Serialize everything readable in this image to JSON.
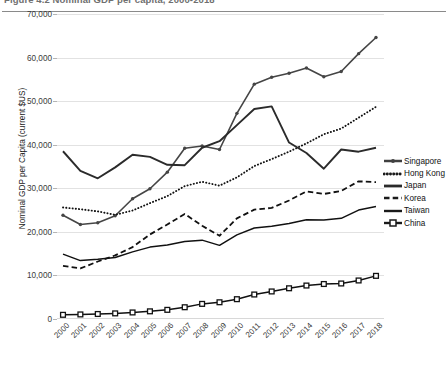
{
  "figure": {
    "caption_clipped": "Figure 4.2  Nominal GDP per capita, 2000-2018",
    "ylabel": "Nominal GDP per Capita (current $US)"
  },
  "legend": {
    "position": "right",
    "items": [
      {
        "label": "Singapore",
        "key": "line-marker-small",
        "color": "#404040"
      },
      {
        "label": "Hong Kong",
        "key": "dotted",
        "color": "#1a1a1a"
      },
      {
        "label": "Japan",
        "key": "solid-thick",
        "color": "#2b2b2b"
      },
      {
        "label": "Korea",
        "key": "dashed",
        "color": "#1a1a1a"
      },
      {
        "label": "Taiwan",
        "key": "solid-thin",
        "color": "#1a1a1a"
      },
      {
        "label": "China",
        "key": "line-marker-square",
        "color": "#1a1a1a"
      }
    ]
  },
  "axes": {
    "y_ticks": [
      "70,000",
      "60,000",
      "50,000",
      "40,000",
      "30,000",
      "20,000",
      "10,000",
      "0"
    ],
    "y_tick_values": [
      70000,
      60000,
      50000,
      40000,
      30000,
      20000,
      10000,
      0
    ],
    "x_ticks": [
      "2000",
      "2001",
      "2002",
      "2003",
      "2004",
      "2005",
      "2006",
      "2007",
      "2008",
      "2009",
      "2010",
      "2011",
      "2012",
      "2013",
      "2014",
      "2015",
      "2016",
      "2017",
      "2018"
    ]
  },
  "chart_data": {
    "type": "line",
    "title": "Figure 4.2  Nominal GDP per capita, 2000-2018",
    "xlabel": "",
    "ylabel": "Nominal GDP per Capita (current $US)",
    "ylim": [
      0,
      70000
    ],
    "grid": true,
    "legend_position": "right",
    "x": [
      2000,
      2001,
      2002,
      2003,
      2004,
      2005,
      2006,
      2007,
      2008,
      2009,
      2010,
      2011,
      2012,
      2013,
      2014,
      2015,
      2016,
      2017,
      2018
    ],
    "series": [
      {
        "name": "Singapore",
        "style": "line-marker-small",
        "values": [
          23800,
          21700,
          22100,
          23700,
          27600,
          29900,
          33700,
          39200,
          39700,
          38900,
          47200,
          53900,
          55500,
          56400,
          57600,
          55600,
          56800,
          60900,
          64600
        ]
      },
      {
        "name": "Hong Kong",
        "style": "dotted",
        "values": [
          25600,
          25200,
          24700,
          23900,
          24900,
          26600,
          28200,
          30500,
          31500,
          30600,
          32500,
          35100,
          36700,
          38400,
          40300,
          42400,
          43700,
          46200,
          48700
        ]
      },
      {
        "name": "Japan",
        "style": "solid-thick",
        "values": [
          38500,
          34000,
          32300,
          34800,
          37700,
          37200,
          35400,
          35300,
          39300,
          40800,
          44500,
          48200,
          48800,
          40500,
          38100,
          34500,
          38900,
          38400,
          39300
        ]
      },
      {
        "name": "Korea",
        "style": "dashed",
        "values": [
          12200,
          11600,
          13200,
          14600,
          16500,
          19400,
          21700,
          24100,
          21400,
          19100,
          23100,
          25100,
          25500,
          27200,
          29300,
          28700,
          29400,
          31600,
          31400
        ]
      },
      {
        "name": "Taiwan",
        "style": "solid-thin",
        "values": [
          14900,
          13400,
          13700,
          14100,
          15400,
          16500,
          17000,
          17800,
          18100,
          16900,
          19300,
          20900,
          21300,
          21900,
          22800,
          22700,
          23100,
          25000,
          25800
        ]
      },
      {
        "name": "China",
        "style": "line-marker-square",
        "values": [
          960,
          1050,
          1150,
          1290,
          1500,
          1760,
          2100,
          2700,
          3470,
          3840,
          4550,
          5620,
          6320,
          7050,
          7680,
          8030,
          8150,
          8840,
          9900
        ]
      }
    ]
  }
}
